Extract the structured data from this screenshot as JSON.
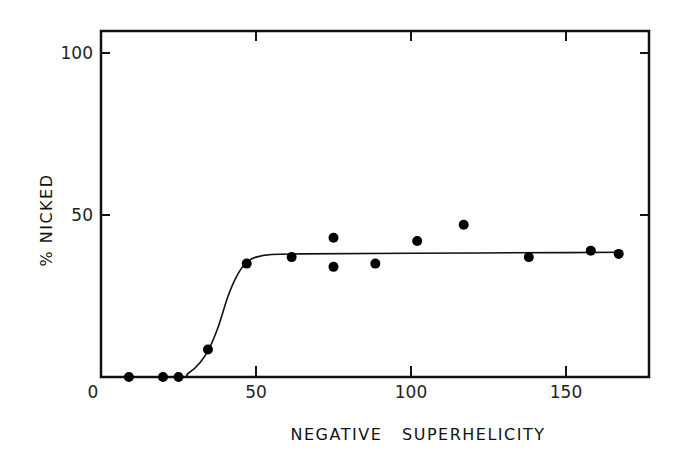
{
  "chart_data": {
    "type": "scatter",
    "title": "",
    "xlabel": "NEGATIVE   SUPERHELICITY",
    "ylabel": "% NICKED",
    "xlim": [
      0,
      175
    ],
    "ylim": [
      0,
      107
    ],
    "x_ticks": [
      0,
      50,
      100,
      150
    ],
    "x_tick_labels": [
      "0",
      "50",
      "100",
      "150"
    ],
    "y_ticks": [
      50,
      100
    ],
    "y_tick_labels": [
      "50",
      "100"
    ],
    "grid": false,
    "legend": null,
    "series": [
      {
        "name": "data points",
        "marker": "filled-circle",
        "points": [
          {
            "x": 9,
            "y": 0
          },
          {
            "x": 20,
            "y": 0
          },
          {
            "x": 25,
            "y": 0
          },
          {
            "x": 34.5,
            "y": 8.5
          },
          {
            "x": 47,
            "y": 35
          },
          {
            "x": 61.5,
            "y": 37
          },
          {
            "x": 75,
            "y": 43
          },
          {
            "x": 75,
            "y": 34
          },
          {
            "x": 88.5,
            "y": 35
          },
          {
            "x": 102,
            "y": 42
          },
          {
            "x": 117,
            "y": 47
          },
          {
            "x": 138,
            "y": 37
          },
          {
            "x": 158,
            "y": 39
          },
          {
            "x": 167,
            "y": 38
          }
        ]
      },
      {
        "name": "fitted curve",
        "style": "line",
        "points": [
          {
            "x": 0,
            "y": 0
          },
          {
            "x": 25,
            "y": 0
          },
          {
            "x": 28,
            "y": 1
          },
          {
            "x": 32,
            "y": 4.5
          },
          {
            "x": 35,
            "y": 9
          },
          {
            "x": 38,
            "y": 16
          },
          {
            "x": 41,
            "y": 25
          },
          {
            "x": 44,
            "y": 31.5
          },
          {
            "x": 47,
            "y": 35.5
          },
          {
            "x": 50,
            "y": 37
          },
          {
            "x": 55,
            "y": 37.8
          },
          {
            "x": 65,
            "y": 38
          },
          {
            "x": 100,
            "y": 38.2
          },
          {
            "x": 150,
            "y": 38.4
          },
          {
            "x": 168,
            "y": 38.5
          }
        ]
      }
    ]
  }
}
